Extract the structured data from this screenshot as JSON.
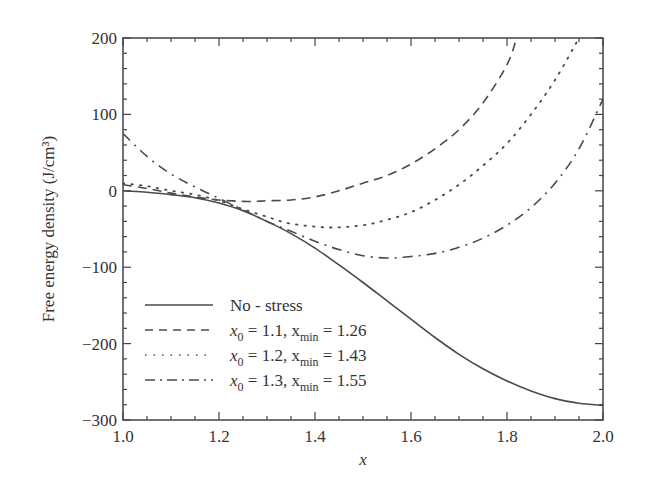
{
  "chart_data": {
    "type": "line",
    "title": "",
    "xlabel": "x",
    "ylabel": "Free energy density (J/cm³)",
    "xlim": [
      1.0,
      2.0
    ],
    "ylim": [
      -300,
      200
    ],
    "x_ticks": [
      "1.0",
      "1.2",
      "1.4",
      "1.6",
      "1.8",
      "2.0"
    ],
    "y_ticks": [
      "200",
      "100",
      "0",
      "−100",
      "−200",
      "−300"
    ],
    "grid": false,
    "legend_position": "lower left",
    "series": [
      {
        "name": "No - stress",
        "style": "solid",
        "x": [
          1.0,
          1.05,
          1.1,
          1.15,
          1.2,
          1.25,
          1.3,
          1.35,
          1.4,
          1.45,
          1.5,
          1.55,
          1.6,
          1.65,
          1.7,
          1.75,
          1.8,
          1.85,
          1.9,
          1.95,
          2.0
        ],
        "values": [
          0,
          -2,
          -5,
          -9,
          -16,
          -26,
          -40,
          -56,
          -75,
          -97,
          -120,
          -144,
          -168,
          -192,
          -214,
          -233,
          -249,
          -262,
          -272,
          -278,
          -281
        ]
      },
      {
        "name": "x0 = 1.1, xmin = 1.26",
        "style": "dashed",
        "x": [
          1.0,
          1.05,
          1.1,
          1.15,
          1.2,
          1.26,
          1.3,
          1.35,
          1.4,
          1.45,
          1.5,
          1.55,
          1.6,
          1.65,
          1.7,
          1.75,
          1.8,
          1.82
        ],
        "values": [
          8,
          3,
          -3,
          -8,
          -12,
          -14,
          -13,
          -12,
          -8,
          0,
          10,
          20,
          35,
          55,
          80,
          115,
          165,
          200
        ]
      },
      {
        "name": "x0 = 1.2, xmin = 1.43",
        "style": "dotted",
        "x": [
          1.0,
          1.05,
          1.1,
          1.15,
          1.2,
          1.25,
          1.3,
          1.35,
          1.43,
          1.5,
          1.55,
          1.6,
          1.65,
          1.7,
          1.75,
          1.8,
          1.85,
          1.9,
          1.95
        ],
        "values": [
          10,
          6,
          0,
          -5,
          -13,
          -24,
          -34,
          -43,
          -48,
          -45,
          -38,
          -28,
          -12,
          8,
          33,
          62,
          100,
          145,
          200
        ]
      },
      {
        "name": "x0 = 1.3, xmin = 1.55",
        "style": "dash-dot",
        "x": [
          1.0,
          1.05,
          1.1,
          1.15,
          1.2,
          1.25,
          1.3,
          1.35,
          1.4,
          1.45,
          1.5,
          1.55,
          1.6,
          1.65,
          1.7,
          1.75,
          1.8,
          1.85,
          1.9,
          1.95,
          2.0
        ],
        "values": [
          75,
          45,
          22,
          5,
          -10,
          -25,
          -40,
          -53,
          -66,
          -77,
          -85,
          -88,
          -86,
          -82,
          -74,
          -62,
          -45,
          -22,
          10,
          55,
          120
        ]
      }
    ]
  },
  "legend": {
    "items": [
      {
        "label": "No - stress"
      },
      {
        "pre": "x",
        "sub0": "0",
        "mid": " = 1.1, x",
        "sub1": "min",
        "post": " = 1.26"
      },
      {
        "pre": "x",
        "sub0": "0",
        "mid": " = 1.2, x",
        "sub1": "min",
        "post": " = 1.43"
      },
      {
        "pre": "x",
        "sub0": "0",
        "mid": " = 1.3, x",
        "sub1": "min",
        "post": " = 1.55"
      }
    ]
  },
  "colors": {
    "axis": "#444444",
    "line": "#4a4a4a",
    "text": "#333333"
  }
}
